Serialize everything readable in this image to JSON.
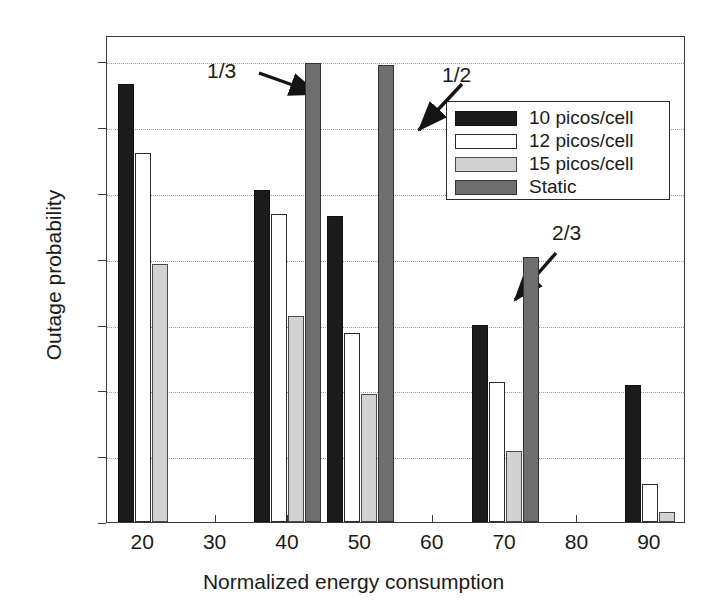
{
  "chart_data": {
    "type": "bar",
    "title": "",
    "xlabel": "Normalized energy consumption",
    "ylabel": "Outage probability",
    "xlim": [
      15,
      95
    ],
    "ylim": [
      0,
      0.148
    ],
    "xticks": [
      20,
      30,
      40,
      50,
      60,
      70,
      80,
      90
    ],
    "xtick_labels": [
      "20",
      "30",
      "40",
      "50",
      "60",
      "70",
      "80",
      "90"
    ],
    "yticks": [
      0,
      0.02,
      0.04,
      0.06,
      0.08,
      0.1,
      0.12,
      0.14
    ],
    "ytick_labels": [
      "0",
      "0.02",
      "0.04",
      "0.06",
      "0.08",
      "0.1",
      "0.12",
      "0.14"
    ],
    "grid": "horizontal-dotted",
    "legend_position": "upper-right-inset",
    "categories": [
      20,
      40,
      50,
      70,
      90
    ],
    "series": [
      {
        "name": "10 picos/cell",
        "color": "#1c1c1c",
        "values": [
          0.133,
          0.101,
          0.093,
          0.06,
          0.0415
        ]
      },
      {
        "name": "12 picos/cell",
        "color": "#ffffff",
        "values": [
          0.112,
          0.0935,
          0.0575,
          0.0425,
          0.0115
        ]
      },
      {
        "name": "15 picos/cell",
        "color": "#d2d2d2",
        "values": [
          0.0783,
          0.0625,
          0.039,
          0.0215,
          0.003
        ]
      },
      {
        "name": "Static",
        "color": "#6e6e6e",
        "values": [
          null,
          0.1395,
          0.139,
          0.0805,
          null
        ]
      }
    ],
    "annotations": [
      {
        "text": "1/3",
        "points_to_series": "Static",
        "points_to_category": 40
      },
      {
        "text": "1/2",
        "points_to_series": "Static",
        "points_to_category": 50
      },
      {
        "text": "2/3",
        "points_to_series": "Static",
        "points_to_category": 70
      }
    ]
  },
  "axes": {
    "xlabel": "Normalized energy consumption",
    "ylabel": "Outage probability"
  },
  "legend": {
    "entries": [
      {
        "label": "10 picos/cell"
      },
      {
        "label": "12 picos/cell"
      },
      {
        "label": "15 picos/cell"
      },
      {
        "label": "Static"
      }
    ]
  },
  "annotations": [
    {
      "label": "1/3"
    },
    {
      "label": "1/2"
    },
    {
      "label": "2/3"
    }
  ],
  "ytick_labels": [
    "0.14",
    "0.12",
    "0.1",
    "0.08",
    "0.06",
    "0.04",
    "0.02",
    "0"
  ],
  "xtick_labels": [
    "20",
    "30",
    "40",
    "50",
    "60",
    "70",
    "80",
    "90"
  ]
}
